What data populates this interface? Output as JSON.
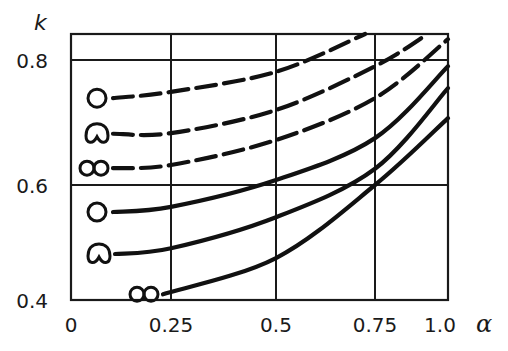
{
  "chart_data": {
    "type": "line",
    "title": "",
    "xlabel": "α",
    "ylabel": "k",
    "xlim": [
      0,
      1.0
    ],
    "ylim": [
      0.4,
      0.84
    ],
    "grid": true,
    "x_ticks": [
      0,
      0.25,
      0.5,
      0.75,
      1.0
    ],
    "x_tick_labels": [
      "0",
      "0.25",
      "0.5",
      "0.75",
      "1.0"
    ],
    "y_ticks": [
      0.4,
      0.6,
      0.8
    ],
    "y_tick_labels": [
      "0.4",
      "0.6",
      "0.8"
    ],
    "legend": "inline shape markers at left end of each curve",
    "series": [
      {
        "name": "circle (dashed)",
        "style": "dashed",
        "marker": "circle",
        "x": [
          0.105,
          0.25,
          0.5,
          0.725
        ],
        "y": [
          0.739,
          0.749,
          0.781,
          0.84
        ]
      },
      {
        "name": "cardioid (dashed)",
        "style": "dashed",
        "marker": "cardioid",
        "x": [
          0.105,
          0.25,
          0.5,
          0.75,
          0.93
        ],
        "y": [
          0.682,
          0.683,
          0.72,
          0.79,
          0.84
        ]
      },
      {
        "name": "double circle (dashed)",
        "style": "dashed",
        "marker": "double-circle",
        "x": [
          0.105,
          0.25,
          0.5,
          0.75,
          1.0
        ],
        "y": [
          0.627,
          0.632,
          0.672,
          0.739,
          0.832
        ]
      },
      {
        "name": "circle (solid)",
        "style": "solid",
        "marker": "circle",
        "x": [
          0.105,
          0.25,
          0.5,
          0.75,
          1.0
        ],
        "y": [
          0.553,
          0.562,
          0.608,
          0.675,
          0.79
        ]
      },
      {
        "name": "cardioid (solid)",
        "style": "solid",
        "marker": "cardioid",
        "x": [
          0.11,
          0.25,
          0.5,
          0.75,
          1.0
        ],
        "y": [
          0.48,
          0.49,
          0.544,
          0.626,
          0.755
        ]
      },
      {
        "name": "double circle (solid)",
        "style": "solid",
        "marker": "double-circle",
        "x": [
          0.23,
          0.5,
          0.75,
          1.0
        ],
        "y": [
          0.41,
          0.473,
          0.6,
          0.707
        ]
      }
    ]
  }
}
